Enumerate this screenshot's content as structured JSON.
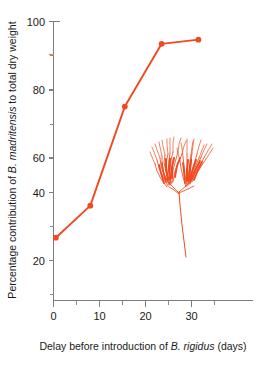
{
  "chart_data": {
    "type": "line",
    "title": "",
    "xlabel_parts": [
      {
        "text": "Delay before introduction of ",
        "italic": false
      },
      {
        "text": "B. rigidus",
        "italic": true
      },
      {
        "text": " (days)",
        "italic": false
      }
    ],
    "ylabel_parts": [
      {
        "text": "Percentage contribution of ",
        "italic": false
      },
      {
        "text": "B. madritensis",
        "italic": true
      },
      {
        "text": " to total dry weight",
        "italic": false
      }
    ],
    "xlabel": "Delay before introduction of B. rigidus (days)",
    "ylabel": "Percentage contribution of B. madritensis to total dry weight",
    "xlim": [
      0,
      35
    ],
    "ylim": [
      0,
      100
    ],
    "xticks": [
      0,
      10,
      20,
      30
    ],
    "xtick_labels": [
      "0",
      "10",
      "20",
      "30"
    ],
    "xminor_ticks": [
      5,
      15,
      25
    ],
    "yticks": [
      20,
      40,
      60,
      80,
      100
    ],
    "ytick_labels": [
      "20",
      "40",
      "60",
      "80",
      "100"
    ],
    "yminor_ticks": [
      10,
      30,
      50,
      70,
      90
    ],
    "grid": false,
    "legend": "none",
    "series": [
      {
        "name": "B. madritensis percentage contribution",
        "color": "#f04a20",
        "marker": "circle",
        "x": [
          0.5,
          8.0,
          15.5,
          23.5,
          31.5
        ],
        "y": [
          22.5,
          34.0,
          69.5,
          92.0,
          93.5
        ]
      }
    ],
    "annotations": [
      {
        "name": "grass-inflorescence-illustration",
        "type": "drawing",
        "description": "Brome grass spikelet illustration",
        "color": "#f04a20"
      }
    ]
  }
}
